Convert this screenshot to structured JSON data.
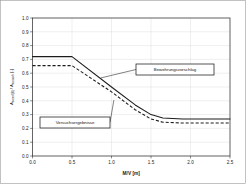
{
  "chart_data": {
    "type": "line",
    "title": "",
    "xlabel": "M/V [m]",
    "ylabel": "A sw,erf(B) / A sw,vorh [-]",
    "ylabel_parts": {
      "main1": "A",
      "sub1": "sw,erf(B)",
      "mid": " / A",
      "sub2": "sw,vorh",
      "tail": " [-]"
    },
    "xlim": [
      0.0,
      2.5
    ],
    "ylim": [
      0.0,
      1.0
    ],
    "grid": true,
    "legend_position": "inline-annotations",
    "xticks": [
      "0.0",
      "0.5",
      "1.0",
      "1.5",
      "2.0",
      "2.5"
    ],
    "xtick_values": [
      0.0,
      0.5,
      1.0,
      1.5,
      2.0,
      2.5
    ],
    "yticks": [
      "0.0",
      "0.1",
      "0.2",
      "0.3",
      "0.4",
      "0.5",
      "0.6",
      "0.7",
      "0.8",
      "0.9",
      "1.0"
    ],
    "ytick_values": [
      0.0,
      0.1,
      0.2,
      0.3,
      0.4,
      0.5,
      0.6,
      0.7,
      0.8,
      0.9,
      1.0
    ],
    "series": [
      {
        "name": "Bewehrungsvorschlag",
        "style": "solid",
        "color": "#1c1c1c",
        "x": [
          0.0,
          0.5,
          1.0,
          1.3,
          1.5,
          1.65,
          1.9,
          2.5
        ],
        "values": [
          0.72,
          0.72,
          0.5,
          0.37,
          0.3,
          0.275,
          0.268,
          0.268
        ]
      },
      {
        "name": "Versuchsergebnisse",
        "style": "dashed",
        "color": "#1c1c1c",
        "x": [
          0.0,
          0.5,
          1.0,
          1.3,
          1.5,
          1.65,
          1.9,
          2.5
        ],
        "values": [
          0.655,
          0.655,
          0.465,
          0.335,
          0.268,
          0.245,
          0.239,
          0.239
        ]
      }
    ],
    "annotations": [
      {
        "label": "Bewehrungsvorschlag",
        "points_to_series": "Bewehrungsvorschlag",
        "point_x": 0.86,
        "point_y": 0.565
      },
      {
        "label": "Versuchsergebnisse",
        "points_to_series": "Versuchsergebnisse",
        "point_x": 1.03,
        "point_y": 0.405
      }
    ]
  }
}
